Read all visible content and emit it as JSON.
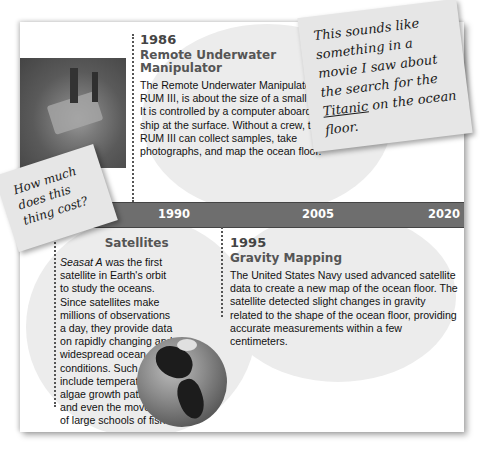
{
  "timeline": {
    "axis_labels": [
      "1990",
      "2005",
      "2020"
    ],
    "entries": [
      {
        "year": "1986",
        "title": "Remote Underwater Manipulator",
        "body": "The Remote Underwater Manipulator, or RUM III, is about the size of a small car. It is controlled by a computer aboard a ship at the surface. Without a crew, the RUM III can collect samples, take photographs, and map the ocean floor."
      },
      {
        "year_partial": "1978",
        "title": "Satellites",
        "body_italic_lead": "Seasat A",
        "body": " was the first satellite in Earth's orbit to study the oceans. Since satellites make millions of observations a day, they provide data on rapidly changing and widespread ocean conditions. Such data include temperatures, algae growth patterns, and even the movement of large schools of fish."
      },
      {
        "year": "1995",
        "title": "Gravity Mapping",
        "body": "The United States Navy used advanced satellite data to create a new map of the ocean floor. The satellite detected slight changes in gravity related to the shape of the ocean floor, providing accurate measurements within a few centimeters."
      }
    ]
  },
  "notes": {
    "right": {
      "before": "This sounds like something in a movie I saw about the search for the ",
      "underlined": "Titanic",
      "after": " on the ocean floor."
    },
    "left": {
      "text": "How much does this thing cost?"
    }
  },
  "images": {
    "photo": "underwater-robot-photo",
    "globe": "earth-globe-image"
  },
  "colors": {
    "timeline_bar": "#6e6e6e",
    "blob": "#ececec",
    "note": "#e6e6e6"
  }
}
